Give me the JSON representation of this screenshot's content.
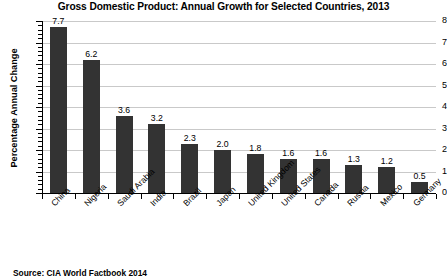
{
  "chart_data": {
    "type": "bar",
    "title": "Gross Domestic Product: Annual Growth for Selected Countries, 2013",
    "xlabel": "",
    "ylabel": "Percentage Annual Change",
    "ylim": [
      0,
      8
    ],
    "ytick_labels": [
      "0",
      "1",
      "2",
      "3",
      "4",
      "5",
      "6",
      "7",
      "8"
    ],
    "ytick_values": [
      0,
      1,
      2,
      3,
      4,
      5,
      6,
      7,
      8
    ],
    "grid": "horizontal",
    "legend": "none",
    "bar_color": "#333333",
    "gridline_color": "#c9c9c9",
    "categories": [
      "China",
      "Nigeria",
      "Saudi Arabia",
      "India",
      "Brazil",
      "Japan",
      "United Kingdom",
      "United States",
      "Canada",
      "Russia",
      "Mexico",
      "Germany"
    ],
    "values": [
      7.7,
      6.2,
      3.6,
      3.2,
      2.3,
      2.0,
      1.8,
      1.6,
      1.6,
      1.3,
      1.2,
      0.5
    ],
    "value_labels": [
      "7.7",
      "6.2",
      "3.6",
      "3.2",
      "2.3",
      "2.0",
      "1.8",
      "1.6",
      "1.6",
      "1.3",
      "1.2",
      "0.5"
    ]
  },
  "source_note": "Source:  CIA World Factbook 2014"
}
